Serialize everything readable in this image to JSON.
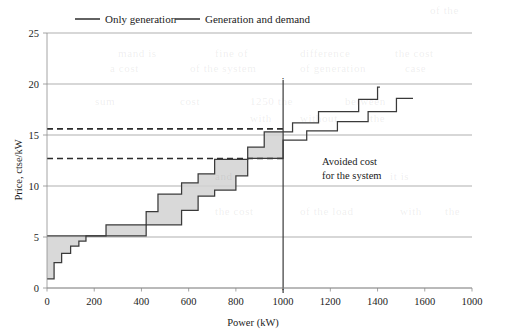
{
  "figure": {
    "background_color": "#ffffff",
    "ink_color": "#1b1b1b",
    "grid_color": "#8d8d8d",
    "band_color": "#d2d2d2",
    "curve_color": "#3a3a3a"
  },
  "legend": {
    "position": "top-center",
    "entries": [
      {
        "label": "Only generation",
        "marker": "line-segment"
      },
      {
        "label": "Generation and demand",
        "marker": "line-segment"
      }
    ]
  },
  "annotations": [
    {
      "name": "avoided-cost-note",
      "line1": "Avoided cost",
      "line2": "for the system",
      "x": 1190,
      "y": 12.7
    },
    {
      "name": "marker-top",
      "text": "·",
      "x": 1000,
      "y": 20.2
    },
    {
      "name": "marker-bottom",
      "text": "·",
      "x": 1000,
      "y": -0.45
    }
  ],
  "bleed_text": [
    {
      "text": "of the",
      "x": 430,
      "y": 4
    },
    {
      "text": "mand is",
      "x": 118,
      "y": 47
    },
    {
      "text": "fine of",
      "x": 215,
      "y": 47
    },
    {
      "text": "difference",
      "x": 300,
      "y": 47
    },
    {
      "text": "the cost",
      "x": 395,
      "y": 47
    },
    {
      "text": "a cost",
      "x": 110,
      "y": 62
    },
    {
      "text": "of the system",
      "x": 190,
      "y": 62
    },
    {
      "text": "of generation",
      "x": 300,
      "y": 62
    },
    {
      "text": "case",
      "x": 405,
      "y": 62
    },
    {
      "text": "sum",
      "x": 95,
      "y": 95
    },
    {
      "text": "cost",
      "x": 180,
      "y": 95
    },
    {
      "text": "1250 the",
      "x": 250,
      "y": 95
    },
    {
      "text": "between",
      "x": 345,
      "y": 95
    },
    {
      "text": "with",
      "x": 250,
      "y": 112
    },
    {
      "text": "without",
      "x": 300,
      "y": 112
    },
    {
      "text": "the",
      "x": 370,
      "y": 112
    },
    {
      "text": "and",
      "x": 215,
      "y": 170
    },
    {
      "text": "it is",
      "x": 390,
      "y": 170
    },
    {
      "text": "the cost",
      "x": 215,
      "y": 205
    },
    {
      "text": "of the load",
      "x": 300,
      "y": 205
    },
    {
      "text": "with",
      "x": 400,
      "y": 205
    },
    {
      "text": "the",
      "x": 445,
      "y": 205
    }
  ],
  "chart_data": {
    "type": "line",
    "title": "",
    "xlabel": "Power (kW)",
    "ylabel": "Price, ctse/kW",
    "xlim": [
      0,
      1800
    ],
    "ylim": [
      0,
      25
    ],
    "xticks": [
      0,
      200,
      400,
      600,
      800,
      1000,
      1200,
      1400,
      1600,
      1800
    ],
    "xtick_labels": [
      "0",
      "200",
      "400",
      "600",
      "800",
      "1000",
      "1200",
      "1400",
      "1600",
      "1000"
    ],
    "yticks": [
      0,
      5,
      10,
      15,
      20,
      25
    ],
    "ytick_labels": [
      "0",
      "5",
      "10",
      "15",
      "20",
      "25"
    ],
    "grid": "horizontal",
    "legend_position": "top-center",
    "step_style": "post",
    "series": [
      {
        "name": "Only generation",
        "color": "#3a3a3a",
        "x": [
          0,
          30,
          62,
          100,
          135,
          165,
          420,
          570,
          640,
          710,
          800,
          850,
          1000,
          1100,
          1230,
          1360,
          1480,
          1550
        ],
        "y": [
          0.9,
          2.5,
          3.4,
          4.1,
          4.6,
          5.1,
          6.2,
          7.6,
          9.0,
          9.6,
          11.0,
          12.7,
          14.5,
          15.4,
          16.3,
          17.3,
          18.6,
          18.6
        ]
      },
      {
        "name": "Generation and demand",
        "color": "#3a3a3a",
        "x": [
          0,
          250,
          420,
          470,
          570,
          640,
          710,
          850,
          920,
          1040,
          1150,
          1320,
          1400,
          1410
        ],
        "y": [
          5.1,
          6.2,
          7.5,
          9.2,
          10.3,
          11.2,
          12.6,
          13.8,
          15.3,
          16.2,
          17.3,
          18.5,
          19.7,
          19.7
        ]
      }
    ],
    "shaded_region": {
      "name": "avoided-cost-band",
      "between": [
        "Only generation",
        "Generation and demand"
      ],
      "x_range": [
        0,
        1000
      ],
      "color": "#d2d2d2"
    },
    "reference_lines": [
      {
        "name": "upper-price-dashed",
        "orientation": "horizontal",
        "value": 15.6,
        "style": "dashed",
        "x_range": [
          0,
          1000
        ]
      },
      {
        "name": "lower-price-dashed",
        "orientation": "horizontal",
        "value": 12.7,
        "style": "dashed",
        "x_range": [
          0,
          1000
        ]
      },
      {
        "name": "demand-vertical",
        "orientation": "vertical",
        "value": 1000,
        "style": "solid",
        "y_range": [
          -0.5,
          20.4
        ]
      }
    ]
  }
}
